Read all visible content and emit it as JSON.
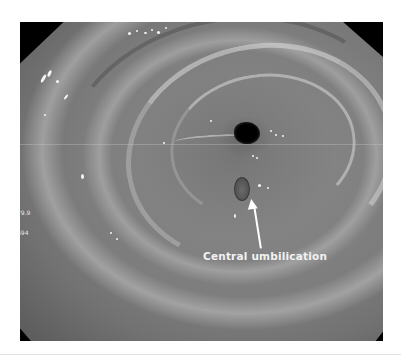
{
  "figure": {
    "type": "endoscopic photograph (grayscale)",
    "annotation": {
      "label": "Central umbilication",
      "pointer": "white arrow pointing up to lesion"
    },
    "overlay_text": [
      "79.9",
      "694"
    ],
    "colors": {
      "background": "#ffffff",
      "mask": "#000000",
      "mucosa": "#7d7d7d",
      "annotation": "#ffffff"
    }
  }
}
